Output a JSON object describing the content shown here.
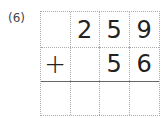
{
  "problem": {
    "label": "(6)",
    "operator": "+",
    "rows": [
      [
        "",
        "2",
        "5",
        "9"
      ],
      [
        "+",
        "",
        "5",
        "6"
      ],
      [
        "",
        "",
        "",
        ""
      ]
    ]
  }
}
